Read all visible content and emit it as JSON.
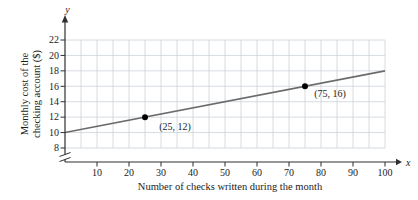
{
  "chart_data": {
    "type": "line",
    "title": "",
    "xlabel": "Number of checks written during the month",
    "ylabel": "Monthly cost of the checking account ($)",
    "ylabel_lines": [
      "Monthly cost of the",
      "checking account ($)"
    ],
    "x_axis_letter": "x",
    "y_axis_letter": "y",
    "xlim": [
      0,
      100
    ],
    "ylim": [
      8,
      22
    ],
    "x_ticks": [
      10,
      20,
      30,
      40,
      50,
      60,
      70,
      80,
      90,
      100
    ],
    "y_ticks": [
      22,
      20,
      18,
      16,
      14,
      12,
      10,
      8
    ],
    "x_grid_step": 5,
    "y_grid_step": 2,
    "grid": true,
    "axis_break": "y-axis broken below 8",
    "legend": "none",
    "series": [
      {
        "name": "monthly-cost-line",
        "x": [
          0,
          100
        ],
        "y": [
          10,
          18
        ]
      }
    ],
    "points": [
      {
        "x": 25,
        "y": 12,
        "label": "(25, 12)",
        "label_offset": [
          30,
          13
        ]
      },
      {
        "x": 75,
        "y": 16,
        "label": "(75, 16)",
        "label_offset": [
          25,
          11
        ]
      }
    ],
    "colors": {
      "background": "#ffffff",
      "grid": "#ccd3da",
      "axis": "#2f2f2f",
      "line": "#6b6b6b",
      "point": "#000000",
      "text": "#1c1c1c"
    }
  }
}
